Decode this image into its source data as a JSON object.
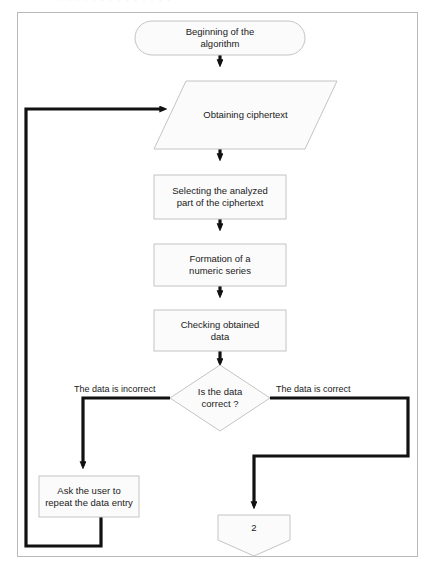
{
  "figure": {
    "type": "flowchart",
    "orientation": "top-to-bottom",
    "border_color": "#b9b9b9",
    "shape_fill": "#fbfbfb",
    "shape_stroke": "#c4c4c4",
    "connector_color": "#111111",
    "background": "#ffffff"
  },
  "nodes": {
    "start": {
      "shape": "terminator",
      "label": "Beginning of the\nalgorithm"
    },
    "obtain": {
      "shape": "parallelogram-input",
      "label": "Obtaining ciphertext"
    },
    "select": {
      "shape": "process",
      "label": "Selecting the analyzed\npart of the ciphertext"
    },
    "formation": {
      "shape": "process",
      "label": "Formation of a\nnumeric series"
    },
    "checking": {
      "shape": "process",
      "label": "Checking obtained\ndata"
    },
    "decision": {
      "shape": "diamond",
      "label": "Is the data\ncorrect ?"
    },
    "ask_user": {
      "shape": "process",
      "label": "Ask the user to\nrepeat the data entry"
    },
    "connector": {
      "shape": "pentagon-offpage",
      "label": "2"
    }
  },
  "edge_labels": {
    "incorrect": "The data is incorrect",
    "correct": "The data is correct"
  },
  "top_bleed": {
    "ghost_text": "· · · · · · · · · · · · · ·"
  }
}
